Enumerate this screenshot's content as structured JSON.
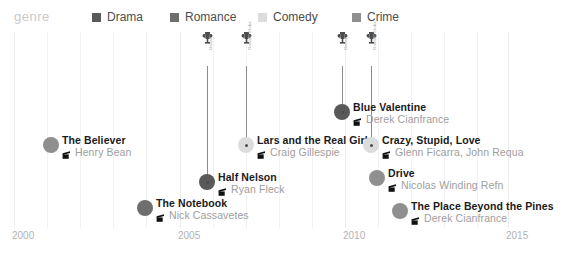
{
  "legend": {
    "title": "genre",
    "items": [
      {
        "label": "Drama",
        "color": "#595959",
        "x": 92
      },
      {
        "label": "Romance",
        "color": "#6e6e6e",
        "x": 170
      },
      {
        "label": "Comedy",
        "color": "#dcdcdc",
        "x": 258
      },
      {
        "label": "Crime",
        "color": "#8f8f8f",
        "x": 352
      }
    ]
  },
  "axis": {
    "label": "",
    "ticks": [
      {
        "label": "2000",
        "x": 14
      },
      {
        "label": "2005",
        "x": 180
      },
      {
        "label": "2010",
        "x": 345
      },
      {
        "label": "2015",
        "x": 508
      }
    ],
    "minor_gridlines": [
      47,
      80,
      113,
      146,
      213,
      246,
      279,
      312,
      378,
      411,
      444,
      477
    ],
    "range": [
      2000,
      2016
    ]
  },
  "awards": [
    {
      "name": "Oscar",
      "x": 207,
      "text_y": 50,
      "stem_top": 66,
      "stem_bottom": 182
    },
    {
      "name": "Golden Globe",
      "x": 246,
      "text_y": 50,
      "stem_top": 66,
      "stem_bottom": 145
    },
    {
      "name": "Oscar",
      "x": 342,
      "text_y": 50,
      "stem_top": 66,
      "stem_bottom": 112
    },
    {
      "name": "Golden Globe",
      "x": 371,
      "text_y": 50,
      "stem_top": 66,
      "stem_bottom": 145
    }
  ],
  "films": [
    {
      "title": "The Believer",
      "director": "Henry Bean",
      "genre": "Crime",
      "color": "#8f8f8f",
      "x": 51,
      "y": 145,
      "ring": false
    },
    {
      "title": "The Notebook",
      "director": "Nick Cassavetes",
      "genre": "Romance",
      "color": "#6e6e6e",
      "x": 145,
      "y": 208,
      "ring": false
    },
    {
      "title": "Half Nelson",
      "director": "Drama",
      "color": "#595959",
      "x": 207,
      "y": 182,
      "ring": true
    },
    {
      "title": "Lars and the Real Girl",
      "director": "Craig Gillespie",
      "genre": "Comedy",
      "color": "#dcdcdc",
      "x": 246,
      "y": 145,
      "ring": true
    },
    {
      "title": "Blue Valentine",
      "director": "Derek Cianfrance",
      "genre": "Drama",
      "color": "#595959",
      "x": 342,
      "y": 112,
      "ring": true
    },
    {
      "title": "Crazy, Stupid, Love",
      "director": "Glenn Ficarra, John Requa",
      "genre": "Comedy",
      "color": "#dcdcdc",
      "x": 371,
      "y": 145,
      "ring": true
    },
    {
      "title": "Drive",
      "director": "Nicolas Winding Refn",
      "genre": "Crime",
      "color": "#8f8f8f",
      "x": 377,
      "y": 178,
      "ring": false
    },
    {
      "title": "The Place Beyond the Pines",
      "director": "Derek Cianfrance",
      "genre": "Crime",
      "color": "#8f8f8f",
      "x": 400,
      "y": 211,
      "ring": false
    }
  ],
  "films_fix": [
    {
      "title": "Half Nelson",
      "director": "Ryan Fleck"
    }
  ],
  "chart_data": {
    "type": "scatter",
    "title": "",
    "xlabel": "",
    "ylabel": "",
    "xlim": [
      2000,
      2016
    ],
    "grid": true,
    "legend_position": "top",
    "categories": [
      "Drama",
      "Romance",
      "Comedy",
      "Crime"
    ],
    "points": [
      {
        "x": 2001,
        "title": "The Believer",
        "director": "Henry Bean",
        "genre": "Crime",
        "awards": []
      },
      {
        "x": 2004,
        "title": "The Notebook",
        "director": "Nick Cassavetes",
        "genre": "Romance",
        "awards": []
      },
      {
        "x": 2006,
        "title": "Half Nelson",
        "director": "Ryan Fleck",
        "genre": "Drama",
        "awards": [
          "Oscar"
        ]
      },
      {
        "x": 2007,
        "title": "Lars and the Real Girl",
        "director": "Craig Gillespie",
        "genre": "Comedy",
        "awards": [
          "Golden Globe"
        ]
      },
      {
        "x": 2010,
        "title": "Blue Valentine",
        "director": "Derek Cianfrance",
        "genre": "Drama",
        "awards": [
          "Oscar"
        ]
      },
      {
        "x": 2011,
        "title": "Crazy, Stupid, Love",
        "director": "Glenn Ficarra, John Requa",
        "genre": "Comedy",
        "awards": [
          "Golden Globe"
        ]
      },
      {
        "x": 2011,
        "title": "Drive",
        "director": "Nicolas Winding Refn",
        "genre": "Crime",
        "awards": []
      },
      {
        "x": 2012,
        "title": "The Place Beyond the Pines",
        "director": "Derek Cianfrance",
        "genre": "Crime",
        "awards": []
      }
    ]
  }
}
